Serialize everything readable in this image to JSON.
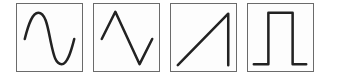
{
  "waveforms": [
    {
      "id": "sine",
      "label": "Sine wave",
      "icon": "sine-wave-icon"
    },
    {
      "id": "triangle",
      "label": "Triangle wave",
      "icon": "triangle-wave-icon"
    },
    {
      "id": "sawtooth",
      "label": "Sawtooth wave",
      "icon": "sawtooth-wave-icon"
    },
    {
      "id": "square",
      "label": "Square wave",
      "icon": "square-wave-icon"
    }
  ],
  "colors": {
    "border": "#6b6b6b",
    "stroke": "#222222",
    "background": "#ffffff"
  }
}
